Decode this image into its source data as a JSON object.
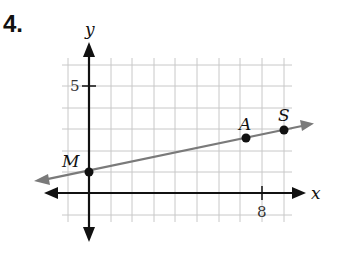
{
  "problem": {
    "number": "4."
  },
  "axes": {
    "x_label": "x",
    "y_label": "y",
    "x_tick_label": "8",
    "y_tick_label": "5"
  },
  "points": [
    {
      "name": "M",
      "x": 0,
      "y": 1
    },
    {
      "name": "A",
      "x": 7,
      "y": 2.56
    },
    {
      "name": "S",
      "x": 9,
      "y": 3
    }
  ],
  "line": {
    "color": "#7a7a7a",
    "through": [
      "M",
      "A",
      "S"
    ]
  },
  "grid": {
    "x_range": [
      -1,
      9
    ],
    "y_range": [
      -1,
      6
    ],
    "color": "#c8c8c8"
  }
}
